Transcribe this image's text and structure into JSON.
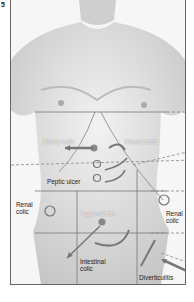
{
  "figure": {
    "number": "5"
  },
  "labels": {
    "biliary_colic": "Biliary colic",
    "pancreatitis": "Pancreatitis",
    "peptic_ulcer": "Peptic ulcer",
    "renal_colic_left": "Renal colic",
    "renal_colic_right": "Renal colic",
    "appendicitis": "Appendicitis",
    "intestinal_colic": "Intestinal colic",
    "diverticulitis": "Diverticulitis"
  },
  "colors": {
    "marker": "#777777",
    "grid": "#777777",
    "skin_light": "#eeeeee",
    "skin_shadow": "#bdbdbd"
  }
}
